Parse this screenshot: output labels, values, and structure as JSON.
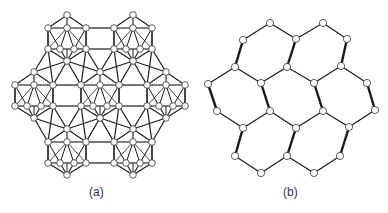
{
  "figure": {
    "panels": [
      {
        "id": "a",
        "label": "(a)",
        "description": "Hexagonal arrangement of seven icosahedral clusters linked by bonds"
      },
      {
        "id": "b",
        "label": "(b)",
        "description": "Honeycomb (hexagonal) network of nodes with alternating thick and thin bonds"
      }
    ]
  },
  "colors": {
    "line": "#1a1a1a",
    "node_fill": "#ffffff",
    "node_stroke": "#333333",
    "text": "#333333"
  },
  "panel_a": {
    "icosahedra_centers": [
      [
        67,
        38
      ],
      [
        133,
        38
      ],
      [
        34,
        95
      ],
      [
        100,
        95
      ],
      [
        166,
        95
      ],
      [
        67,
        152
      ],
      [
        133,
        152
      ]
    ]
  },
  "panel_b": {
    "nodes": [
      [
        270,
        23
      ],
      [
        323,
        23
      ],
      [
        243,
        40
      ],
      [
        296,
        39
      ],
      [
        347,
        39
      ],
      [
        235,
        67
      ],
      [
        287,
        67
      ],
      [
        341,
        66
      ],
      [
        208,
        84
      ],
      [
        261,
        83
      ],
      [
        314,
        83
      ],
      [
        367,
        83
      ],
      [
        217,
        111
      ],
      [
        270,
        111
      ],
      [
        323,
        111
      ],
      [
        375,
        110
      ],
      [
        243,
        128
      ],
      [
        296,
        128
      ],
      [
        349,
        127
      ],
      [
        235,
        156
      ],
      [
        287,
        156
      ],
      [
        340,
        156
      ],
      [
        261,
        173
      ],
      [
        314,
        173
      ]
    ],
    "thin_edges": [
      [
        0,
        2
      ],
      [
        0,
        3
      ],
      [
        1,
        3
      ],
      [
        1,
        4
      ],
      [
        5,
        8
      ],
      [
        5,
        9
      ],
      [
        6,
        9
      ],
      [
        6,
        10
      ],
      [
        7,
        10
      ],
      [
        7,
        11
      ],
      [
        12,
        16
      ],
      [
        13,
        16
      ],
      [
        13,
        17
      ],
      [
        14,
        17
      ],
      [
        14,
        18
      ],
      [
        15,
        18
      ],
      [
        19,
        22
      ],
      [
        22,
        20
      ],
      [
        20,
        23
      ],
      [
        23,
        21
      ]
    ],
    "thick_edges": [
      [
        2,
        5
      ],
      [
        3,
        6
      ],
      [
        4,
        7
      ],
      [
        8,
        12
      ],
      [
        9,
        13
      ],
      [
        10,
        14
      ],
      [
        11,
        15
      ],
      [
        16,
        19
      ],
      [
        17,
        20
      ],
      [
        18,
        21
      ]
    ]
  }
}
